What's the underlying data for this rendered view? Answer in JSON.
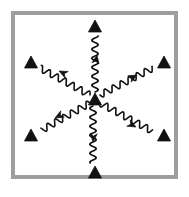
{
  "figure": {
    "canvas": {
      "width": 189,
      "height": 197,
      "background": "#ffffff"
    },
    "frame": {
      "name": "outer-square-frame",
      "x": 11,
      "y": 11,
      "width": 167,
      "height": 168,
      "stroke_color": "#9e9e9e",
      "stroke_width": 4,
      "fill": "none"
    },
    "center_marker": {
      "name": "center-triangle",
      "cx": 95,
      "cy": 99,
      "size": 13,
      "color": "#111111",
      "shape": "triangle-up"
    },
    "outer_markers": [
      {
        "id": "top",
        "label": "top",
        "cx": 95,
        "cy": 26,
        "size": 13,
        "color": "#111111",
        "shape": "triangle-up"
      },
      {
        "id": "upper-left",
        "label": "upper left",
        "cx": 31,
        "cy": 62,
        "size": 13,
        "color": "#111111",
        "shape": "triangle-up"
      },
      {
        "id": "upper-right",
        "label": "upper right",
        "cx": 164,
        "cy": 62,
        "size": 13,
        "color": "#111111",
        "shape": "triangle-up"
      },
      {
        "id": "lower-left",
        "label": "lower left",
        "cx": 31,
        "cy": 135,
        "size": 13,
        "color": "#111111",
        "shape": "triangle-up"
      },
      {
        "id": "lower-right",
        "label": "lower right",
        "cx": 164,
        "cy": 135,
        "size": 13,
        "color": "#111111",
        "shape": "triangle-up"
      },
      {
        "id": "bottom",
        "label": "bottom",
        "cx": 95,
        "cy": 172,
        "size": 13,
        "color": "#111111",
        "shape": "triangle-up"
      }
    ],
    "wavy_arrows": [
      {
        "id": "arrow-up",
        "label": "wavy arrow up",
        "direction": "up",
        "from": {
          "x": 95,
          "y": 92
        },
        "to": {
          "x": 95,
          "y": 36
        },
        "arrowhead_at": {
          "x": 97,
          "y": 55
        },
        "arrowhead_angle_deg": -80,
        "color": "#111111",
        "stroke_width": 1.6,
        "wave_amplitude": 3.2,
        "wave_period": 9
      },
      {
        "id": "arrow-down",
        "label": "wavy arrow down",
        "direction": "down",
        "from": {
          "x": 93,
          "y": 106
        },
        "to": {
          "x": 93,
          "y": 163
        },
        "arrowhead_at": {
          "x": 93,
          "y": 142
        },
        "arrowhead_angle_deg": 95,
        "color": "#111111",
        "stroke_width": 1.6,
        "wave_amplitude": 3.2,
        "wave_period": 9
      },
      {
        "id": "arrow-upper-left",
        "label": "wavy arrow upper left",
        "direction": "upper-left",
        "from": {
          "x": 90,
          "y": 95
        },
        "to": {
          "x": 40,
          "y": 68
        },
        "arrowhead_at": {
          "x": 59,
          "y": 71
        },
        "arrowhead_angle_deg": 206,
        "color": "#111111",
        "stroke_width": 1.6,
        "wave_amplitude": 3.2,
        "wave_period": 9
      },
      {
        "id": "arrow-upper-right",
        "label": "wavy arrow upper right",
        "direction": "upper-right",
        "from": {
          "x": 100,
          "y": 95
        },
        "to": {
          "x": 153,
          "y": 68
        },
        "arrowhead_at": {
          "x": 137,
          "y": 75
        },
        "arrowhead_angle_deg": -28,
        "color": "#111111",
        "stroke_width": 1.6,
        "wave_amplitude": 3.2,
        "wave_period": 9
      },
      {
        "id": "arrow-lower-left",
        "label": "wavy arrow lower left",
        "direction": "lower-left",
        "from": {
          "x": 90,
          "y": 103
        },
        "to": {
          "x": 42,
          "y": 130
        },
        "arrowhead_at": {
          "x": 55,
          "y": 118
        },
        "arrowhead_angle_deg": 152,
        "color": "#111111",
        "stroke_width": 1.6,
        "wave_amplitude": 3.2,
        "wave_period": 9
      },
      {
        "id": "arrow-lower-right",
        "label": "wavy arrow lower right",
        "direction": "lower-right",
        "from": {
          "x": 100,
          "y": 103
        },
        "to": {
          "x": 152,
          "y": 131
        },
        "arrowhead_at": {
          "x": 136,
          "y": 127
        },
        "arrowhead_angle_deg": 28,
        "color": "#111111",
        "stroke_width": 1.6,
        "wave_amplitude": 3.2,
        "wave_period": 9
      }
    ]
  }
}
